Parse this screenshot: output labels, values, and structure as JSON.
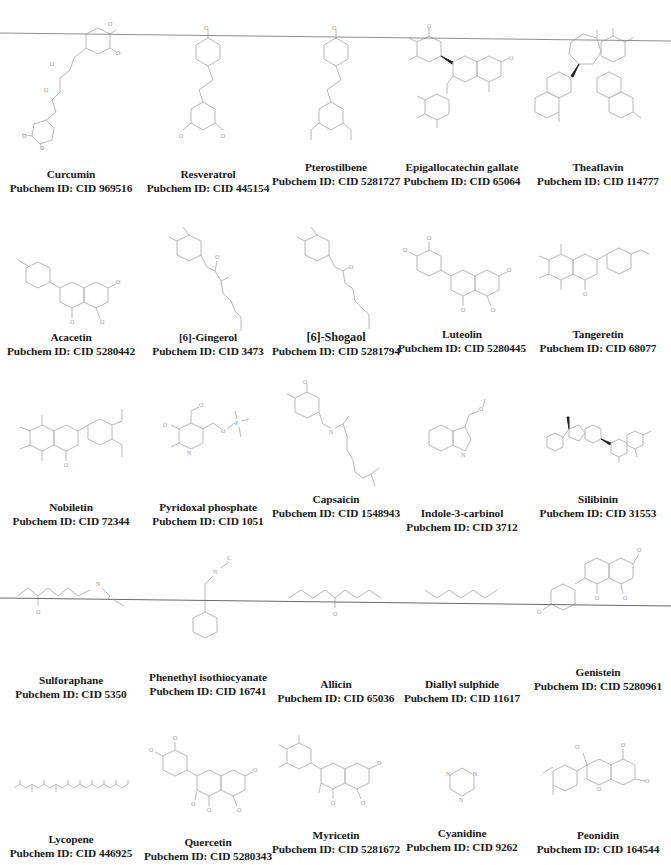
{
  "figure": {
    "columns": 5,
    "rows": 6,
    "id_prefix": "Pubchem ID: ",
    "compounds": [
      {
        "name": "Curcumin",
        "cid": "Pubchem ID: CID 969516",
        "structure": "curcumin"
      },
      {
        "name": "Resveratrol",
        "cid": "Pubchem ID: CID 445154",
        "structure": "stilbene"
      },
      {
        "name": "Pterostilbene",
        "cid": "Pubchem ID: CID 5281727",
        "structure": "stilbene-methoxy"
      },
      {
        "name": "Epigallocatechin gallate",
        "cid": "Pubchem ID: CID 65064",
        "structure": "egcg"
      },
      {
        "name": "Theaflavin",
        "cid": "Pubchem ID: CID 114777",
        "structure": "theaflavin"
      },
      {
        "name": "Acacetin",
        "cid": "Pubchem ID: CID 5280442",
        "structure": "flavone"
      },
      {
        "name": "[6]-Gingerol",
        "cid": "Pubchem ID: CID 3473",
        "structure": "gingerol"
      },
      {
        "name": "[6]-Shogaol",
        "cid": "Pubchem ID: CID 5281794",
        "structure": "shogaol"
      },
      {
        "name": "Luteolin",
        "cid": "Pubchem ID: CID 5280445",
        "structure": "flavone-catechol"
      },
      {
        "name": "Tangeretin",
        "cid": "Pubchem ID: CID 68077",
        "structure": "polymethoxyflavone"
      },
      {
        "name": "Nobiletin",
        "cid": "Pubchem ID: CID 72344",
        "structure": "polymethoxyflavone-2"
      },
      {
        "name": "Pyridoxal phosphate",
        "cid": "Pubchem ID: CID 1051",
        "structure": "pyridoxal"
      },
      {
        "name": "Capsaicin",
        "cid": "Pubchem ID: CID 1548943",
        "structure": "capsaicin"
      },
      {
        "name": "Indole-3-carbinol",
        "cid": "Pubchem ID: CID 3712",
        "structure": "indole"
      },
      {
        "name": "Silibinin",
        "cid": "Pubchem ID: CID 31553",
        "structure": "silibinin"
      },
      {
        "name": "Sulforaphane",
        "cid": "Pubchem ID: CID 5350",
        "structure": "chain-ncs"
      },
      {
        "name": "Phenethyl isothiocyanate",
        "cid": "Pubchem ID: CID 16741",
        "structure": "phenethyl"
      },
      {
        "name": "Allicin",
        "cid": "Pubchem ID: CID 65036",
        "structure": "chain-so"
      },
      {
        "name": "Diallyl sulphide",
        "cid": "Pubchem ID: CID 11617",
        "structure": "chain-s"
      },
      {
        "name": "Genistein",
        "cid": "Pubchem ID: CID 5280961",
        "structure": "isoflavone"
      },
      {
        "name": "Lycopene",
        "cid": "Pubchem ID: CID 446925",
        "structure": "polyene"
      },
      {
        "name": "Quercetin",
        "cid": "Pubchem ID: CID 5280343",
        "structure": "flavonol"
      },
      {
        "name": "Myricetin",
        "cid": "Pubchem ID: CID 5281672",
        "structure": "flavonol-2"
      },
      {
        "name": "Cyanidine",
        "cid": "Pubchem ID: CID 9262",
        "structure": "triazine"
      },
      {
        "name": "Peonidin",
        "cid": "Pubchem ID: CID 164544",
        "structure": "anthocyanidin"
      }
    ]
  },
  "overlay_lines": [
    {
      "name": "scan-line-top",
      "x1": 0,
      "y1": 33,
      "x2": 671,
      "y2": 41
    },
    {
      "name": "scan-line-middle",
      "x1": 0,
      "y1": 598,
      "x2": 671,
      "y2": 606
    }
  ],
  "colors": {
    "structure_stroke": "#b9b9b9",
    "label_text": "#1a1a1a",
    "overlay_line": "#8a8a8a",
    "background": "#ffffff"
  }
}
